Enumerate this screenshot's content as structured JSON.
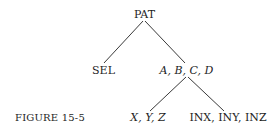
{
  "caption": "FIGURE 15-5",
  "tree": {
    "root": "PAT",
    "children": [
      {
        "label": "SEL",
        "italic": false,
        "children": []
      },
      {
        "label": "A, B, C, D",
        "italic": true,
        "children": [
          {
            "label": "X, Y, Z",
            "italic": true,
            "children": []
          },
          {
            "label": "INX, INY, INZ",
            "italic": false,
            "children": []
          }
        ]
      }
    ]
  },
  "colors": {
    "line": "#3a3a3a",
    "text": "#1e1e1e",
    "background": "#ffffff"
  }
}
